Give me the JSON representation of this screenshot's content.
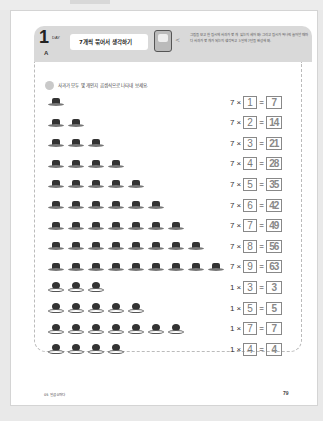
{
  "header": {
    "day_number": "1",
    "day_label": "DAY",
    "day_section": "A",
    "title": "7개씩 묶어서 생각하기",
    "instructions": "그림을 보고 한 접시에 사과가 몇 개 있는지 세어 봐! 그리고 접시가 하나씩 늘어날 때마다 사과가 몇 개가 되는지 생각하고 3일에 7단을 완성해 봐."
  },
  "question": "사과가 모두 몇 개인지 곱셈식으로 나타내 보세요.",
  "rows": [
    {
      "type": "hat",
      "count": 1,
      "a": "7",
      "b": "1",
      "result": "7"
    },
    {
      "type": "hat",
      "count": 2,
      "a": "7",
      "b": "2",
      "result": "14"
    },
    {
      "type": "hat",
      "count": 3,
      "a": "7",
      "b": "3",
      "result": "21"
    },
    {
      "type": "hat",
      "count": 4,
      "a": "7",
      "b": "4",
      "result": "28"
    },
    {
      "type": "hat",
      "count": 5,
      "a": "7",
      "b": "5",
      "result": "35"
    },
    {
      "type": "hat",
      "count": 6,
      "a": "7",
      "b": "6",
      "result": "42"
    },
    {
      "type": "hat",
      "count": 7,
      "a": "7",
      "b": "7",
      "result": "49"
    },
    {
      "type": "hat",
      "count": 8,
      "a": "7",
      "b": "8",
      "result": "56"
    },
    {
      "type": "hat",
      "count": 9,
      "a": "7",
      "b": "9",
      "result": "63"
    },
    {
      "type": "ball",
      "count": 3,
      "a": "1",
      "b": "3",
      "result": "3"
    },
    {
      "type": "ball",
      "count": 5,
      "a": "1",
      "b": "5",
      "result": "5"
    },
    {
      "type": "ball",
      "count": 7,
      "a": "1",
      "b": "7",
      "result": "7"
    },
    {
      "type": "ball",
      "count": 4,
      "a": "1",
      "b": "4",
      "result": "4"
    }
  ],
  "symbols": {
    "times": "×",
    "equals": "="
  },
  "footer": {
    "left": "05 일곱 0마다",
    "page_number": "79"
  }
}
